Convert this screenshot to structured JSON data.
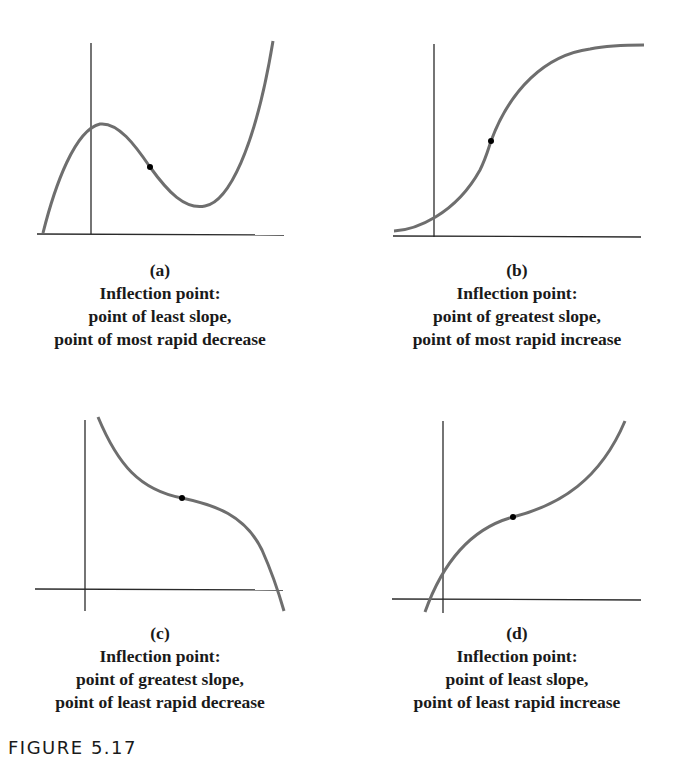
{
  "figure": {
    "label": "FIGURE 5.17",
    "colors": {
      "curve": "#6e6e6e",
      "axis": "#2a2a2a",
      "dot": "#000000",
      "text": "#1a1a1a"
    },
    "panels": [
      {
        "id": "a",
        "tag": "(a)",
        "title": "Inflection point:",
        "line1": "point of least slope,",
        "line2": "point of most rapid decrease",
        "shape": "cubic with local max then local min; inflection on decreasing segment"
      },
      {
        "id": "b",
        "tag": "(b)",
        "title": "Inflection point:",
        "line1": "point of greatest slope,",
        "line2": "point of most rapid increase",
        "shape": "S-shaped (logistic) increasing curve; inflection at steepest point"
      },
      {
        "id": "c",
        "tag": "(c)",
        "title": "Inflection point:",
        "line1": "point of greatest slope,",
        "line2": "point of least rapid decrease",
        "shape": "decreasing cubic that flattens then drops; inflection at flattest point"
      },
      {
        "id": "d",
        "tag": "(d)",
        "title": "Inflection point:",
        "line1": "point of least slope,",
        "line2": "point of least rapid increase",
        "shape": "increasing cubic that flattens then rises; inflection at flattest point"
      }
    ]
  }
}
